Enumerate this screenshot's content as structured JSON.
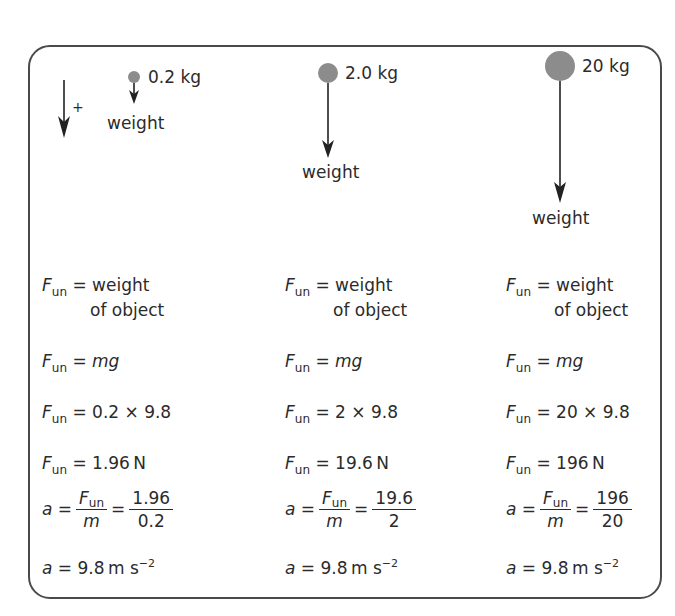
{
  "direction_indicator": {
    "sign": "+"
  },
  "columns": [
    {
      "mass_label": "0.2 kg",
      "weight_label": "weight",
      "lines": {
        "definition": [
          "weight",
          "of object"
        ],
        "formula": "mg",
        "substitution": "0.2 × 9.8",
        "result_value": "1.96",
        "result_unit": "N",
        "frac_num": "1.96",
        "frac_den": "0.2",
        "accel_value": "9.8",
        "accel_unit": "m s",
        "accel_exp": "−2"
      }
    },
    {
      "mass_label": "2.0 kg",
      "weight_label": "weight",
      "lines": {
        "definition": [
          "weight",
          "of object"
        ],
        "formula": "mg",
        "substitution": "2 × 9.8",
        "result_value": "19.6",
        "result_unit": "N",
        "frac_num": "19.6",
        "frac_den": "2",
        "accel_value": "9.8",
        "accel_unit": "m s",
        "accel_exp": "−2"
      }
    },
    {
      "mass_label": "20 kg",
      "weight_label": "weight",
      "lines": {
        "definition": [
          "weight",
          "of object"
        ],
        "formula": "mg",
        "substitution": "20 × 9.8",
        "result_value": "196",
        "result_unit": "N",
        "frac_num": "196",
        "frac_den": "20",
        "accel_value": "9.8",
        "accel_unit": "m s",
        "accel_exp": "−2"
      }
    }
  ],
  "symbols": {
    "F": "F",
    "sub": "un",
    "eq": " = ",
    "a": "a",
    "m": "m"
  },
  "colors": {
    "mass": "#8c8c8c",
    "border": "#4a4a4a",
    "text": "#2b2b2b"
  }
}
